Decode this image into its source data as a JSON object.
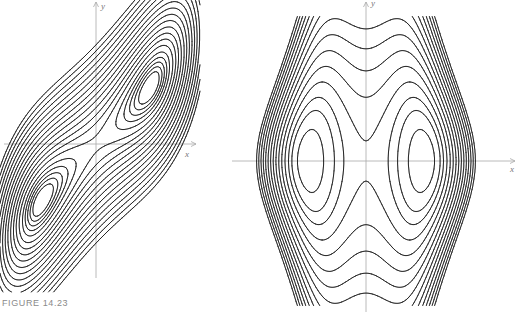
{
  "figure": {
    "caption": "FIGURE 14.23",
    "background": "#ffffff",
    "line_color": "#1a1a1a",
    "axis_color": "#a8a8a8"
  },
  "panels": [
    {
      "id": "left",
      "description": "Contour curves of a sheared double-well function: two nested families around minima, enclosed by outer closed curves",
      "x_axis_label": "x",
      "y_axis_label": "y",
      "origin_px": [
        96,
        144
      ],
      "x_axis_span_px": [
        4,
        196
      ],
      "y_axis_span_px": [
        2,
        278
      ],
      "centers_px": [
        [
          152,
          85
        ],
        [
          41,
          199
        ]
      ],
      "shear": 1.05,
      "scale": 44,
      "levels": [
        -0.22,
        -0.16,
        -0.09,
        0.0,
        0.12,
        0.3,
        0.5,
        0.72,
        0.98,
        1.28,
        1.6,
        1.96,
        2.36,
        2.8,
        3.28,
        3.8,
        4.36,
        4.96,
        5.6
      ],
      "draw_window_px": [
        0,
        0,
        200,
        292
      ]
    },
    {
      "id": "right",
      "description": "Level curves of a symmetric two-centre function: closed ovals around two centres on the x-axis, separatrix through origin, outer curves opening vertically",
      "x_axis_label": "x",
      "y_axis_label": "y",
      "origin_px": [
        366,
        161
      ],
      "x_axis_span_px": [
        232,
        515
      ],
      "y_axis_span_px": [
        2,
        312
      ],
      "centers_px": [
        [
          311,
          161
        ],
        [
          424,
          161
        ]
      ],
      "scale": 57,
      "levels": [
        -0.21,
        -0.15,
        -0.08,
        -0.02,
        0.06,
        0.15,
        0.25,
        0.36,
        0.48,
        0.61,
        0.75,
        0.9,
        1.06,
        1.23,
        1.41,
        1.6
      ],
      "draw_window_px": [
        236,
        16,
        500,
        306
      ]
    }
  ]
}
